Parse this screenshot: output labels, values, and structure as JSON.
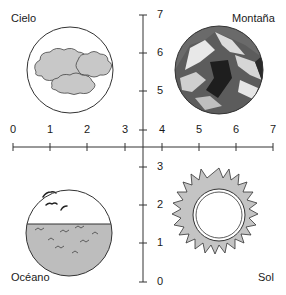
{
  "quadrants": {
    "top_left": {
      "label": "Cielo",
      "icon": "clouds-icon"
    },
    "top_right": {
      "label": "Montaña",
      "icon": "mountain-icon"
    },
    "bottom_left": {
      "label": "Océano",
      "icon": "ocean-icon"
    },
    "bottom_right": {
      "label": "Sol",
      "icon": "sun-icon"
    }
  },
  "x_axis": {
    "ticks": [
      "0",
      "1",
      "2",
      "3",
      "4",
      "5",
      "6",
      "7"
    ]
  },
  "y_axis": {
    "ticks": [
      "7",
      "6",
      "5",
      "4",
      "3",
      "2",
      "1",
      "0"
    ]
  },
  "colors": {
    "line": "#333333",
    "fill_gray": "#bdbdbd",
    "dark": "#3a3a3a"
  }
}
